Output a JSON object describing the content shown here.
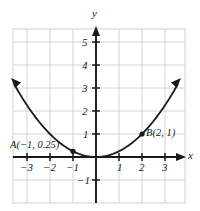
{
  "figure": {
    "kind": "cartesian-graph",
    "background_color": "#ffffff",
    "grid_color": "#c9c9c9",
    "border_color": "#c9c9c9",
    "axis_color": "#1a1a1a",
    "curve_color": "#1a1a1a",
    "label_color": "#1a1a1a"
  },
  "chart_data": {
    "type": "line",
    "title": "",
    "xlabel": "x",
    "ylabel": "y",
    "function": "y = x^2 / 4",
    "xlim": [
      -3.6,
      3.9
    ],
    "ylim": [
      -1.6,
      5.5
    ],
    "grid": true,
    "legend": null,
    "x_tick_labels": [
      "-3",
      "-2",
      "-1",
      "1",
      "2",
      "3"
    ],
    "x_tick_values": [
      -3,
      -2,
      -1,
      1,
      2,
      3
    ],
    "y_tick_labels": [
      "5",
      "4",
      "3",
      "2",
      "1",
      "-1"
    ],
    "y_tick_values": [
      5,
      4,
      3,
      2,
      1,
      -1
    ],
    "series": [
      {
        "name": "parabola",
        "x": [
          -3.55,
          -3.2,
          -2.8,
          -2.4,
          -2.0,
          -1.6,
          -1.2,
          -0.8,
          -0.4,
          0,
          0.4,
          0.8,
          1.2,
          1.6,
          2.0,
          2.4,
          2.8,
          3.2,
          3.55
        ],
        "y": [
          3.15,
          2.56,
          1.96,
          1.44,
          1.0,
          0.64,
          0.36,
          0.16,
          0.04,
          0,
          0.04,
          0.16,
          0.36,
          0.64,
          1.0,
          1.44,
          1.96,
          2.56,
          3.15
        ]
      }
    ],
    "points": [
      {
        "id": "A",
        "label": "A(−1, 0.25)",
        "x": -1,
        "y": 0.25
      },
      {
        "id": "B",
        "label": "B(2, 1)",
        "x": 2,
        "y": 1
      }
    ],
    "annotations": [
      {
        "name": "y-axis-name",
        "text": "y"
      },
      {
        "name": "x-axis-name",
        "text": "x"
      }
    ]
  },
  "axis_labels": {
    "x_name": "x",
    "y_name": "y",
    "x_neg3": "−3",
    "x_neg2": "−2",
    "x_neg1": "−1",
    "x_pos1": "1",
    "x_pos2": "2",
    "x_pos3": "3",
    "y_pos5": "5",
    "y_pos4": "4",
    "y_pos3": "3",
    "y_pos2": "2",
    "y_pos1": "1",
    "y_neg1": "−1"
  },
  "point_labels": {
    "a": "A(−1, 0.25)",
    "b": "B(2, 1)"
  }
}
